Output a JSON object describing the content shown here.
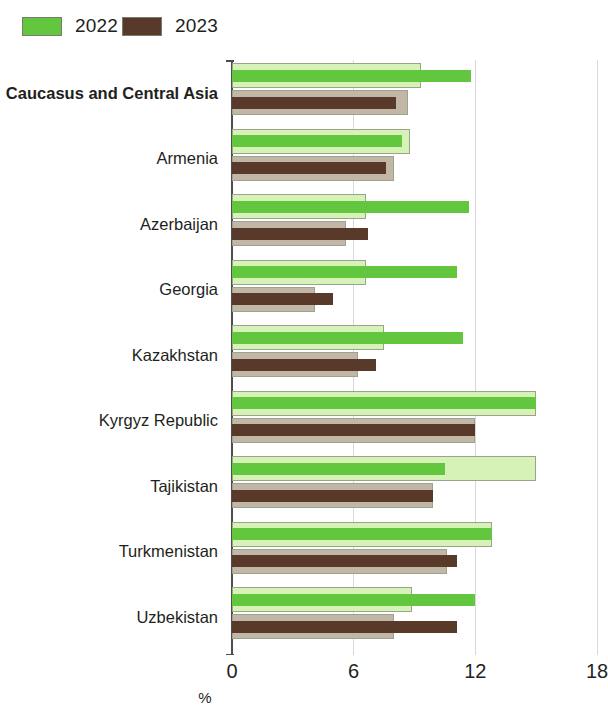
{
  "legend": {
    "entries": [
      {
        "label": "2022",
        "color": "#63c63f"
      },
      {
        "label": "2023",
        "color": "#59392a"
      }
    ]
  },
  "axis": {
    "x_title": "%",
    "ticks": [
      "0",
      "6",
      "12",
      "18"
    ]
  },
  "chart_data": {
    "type": "bar",
    "orientation": "horizontal",
    "title": "",
    "subtitle": "",
    "xlabel": "%",
    "ylabel": "",
    "xlim": [
      0,
      18
    ],
    "xticks": [
      0,
      6,
      12,
      18
    ],
    "grid": true,
    "legend_position": "top-left",
    "categories": [
      "Caucasus and Central Asia",
      "Armenia",
      "Azerbaijan",
      "Georgia",
      "Kazakhstan",
      "Kyrgyz Republic",
      "Tajikistan",
      "Turkmenistan",
      "Uzbekistan"
    ],
    "series": [
      {
        "name": "2022",
        "color": "#63c63f",
        "band_color": "#d7f2b6",
        "values": [
          11.8,
          8.4,
          11.7,
          11.1,
          11.4,
          15.0,
          10.5,
          12.8,
          12.0
        ],
        "band_values": [
          9.3,
          8.8,
          6.6,
          6.6,
          7.5,
          15.0,
          15.0,
          12.8,
          8.9
        ]
      },
      {
        "name": "2023",
        "color": "#59392a",
        "band_color": "#c2b6a6",
        "values": [
          8.1,
          7.6,
          6.7,
          5.0,
          7.1,
          12.0,
          9.9,
          11.1,
          11.1
        ],
        "band_values": [
          8.7,
          8.0,
          5.6,
          4.1,
          6.2,
          12.0,
          9.9,
          10.6,
          8.0
        ]
      }
    ]
  }
}
